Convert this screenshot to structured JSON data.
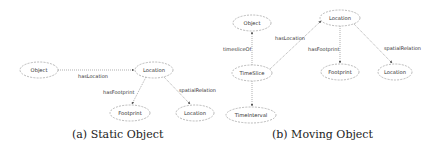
{
  "figures": [
    {
      "id": "a",
      "caption": "(a) Static Object",
      "nodes": [
        {
          "key": "object",
          "label": "Object",
          "cx": 39,
          "cy": 70,
          "rx": 19,
          "ry": 8
        },
        {
          "key": "location",
          "label": "Location",
          "cx": 154,
          "cy": 70,
          "rx": 19,
          "ry": 8
        },
        {
          "key": "footprint",
          "label": "Footprint",
          "cx": 130,
          "cy": 113,
          "rx": 20,
          "ry": 8
        },
        {
          "key": "location2",
          "label": "Location",
          "cx": 195,
          "cy": 113,
          "rx": 19,
          "ry": 8
        }
      ],
      "edges": [
        {
          "from": "object",
          "to": "location",
          "label": "hasLocation"
        },
        {
          "from": "location",
          "to": "footprint",
          "label": "hasFootprint"
        },
        {
          "from": "location",
          "to": "location2",
          "label": "spatialRelation"
        }
      ]
    },
    {
      "id": "b",
      "caption": "(b) Moving Object",
      "nodes": [
        {
          "key": "object",
          "label": "Object",
          "cx": 252,
          "cy": 23,
          "rx": 19,
          "ry": 8
        },
        {
          "key": "timeslice",
          "label": "TimeSlice",
          "cx": 252,
          "cy": 73,
          "rx": 20,
          "ry": 8
        },
        {
          "key": "timeinterval",
          "label": "TimeInterval",
          "cx": 251,
          "cy": 115,
          "rx": 25,
          "ry": 8
        },
        {
          "key": "location",
          "label": "Location",
          "cx": 340,
          "cy": 18,
          "rx": 20,
          "ry": 8
        },
        {
          "key": "footprint",
          "label": "Footprint",
          "cx": 340,
          "cy": 72,
          "rx": 19,
          "ry": 8
        },
        {
          "key": "location2",
          "label": "Location",
          "cx": 395,
          "cy": 72,
          "rx": 17,
          "ry": 8
        }
      ],
      "edges": [
        {
          "from": "timeslice",
          "to": "object",
          "label": "timesliceOf"
        },
        {
          "from": "timeslice",
          "to": "timeinterval",
          "label": ""
        },
        {
          "from": "timeslice",
          "to": "location",
          "label": "hasLocation"
        },
        {
          "from": "location",
          "to": "footprint",
          "label": "hasFootprint"
        },
        {
          "from": "location",
          "to": "location2",
          "label": "spatialRelation"
        }
      ]
    }
  ],
  "labels": {
    "a_hasLocation": "hasLocation",
    "a_hasFootprint": "hasFootprint",
    "a_spatialRelation": "spatialRelation",
    "b_timesliceOf": "timesliceOf",
    "b_hasLocation": "hasLocation",
    "b_hasFootprint": "hasFootprint",
    "b_spatialRelation": "spatialRelation"
  },
  "captions": {
    "a": "(a) Static Object",
    "b": "(b) Moving Object"
  },
  "colors": {
    "node_stroke": "#a8a8a8",
    "edge_stroke": "#8c8c8c",
    "text": "#333333"
  }
}
